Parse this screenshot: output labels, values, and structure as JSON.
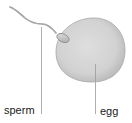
{
  "diagram": {
    "type": "labeled biological illustration",
    "labels": [
      {
        "id": "sperm",
        "text": "sperm"
      },
      {
        "id": "egg",
        "text": "egg"
      }
    ],
    "colors": {
      "background": "#ffffff",
      "egg_fill": "#d6d6d6",
      "egg_edge": "#a8a8a8",
      "sperm_fill": "#c8c8c8",
      "sperm_stroke": "#8a8a8a",
      "leader_line": "#9a9a9a",
      "label_text": "#1a1a1a"
    }
  }
}
